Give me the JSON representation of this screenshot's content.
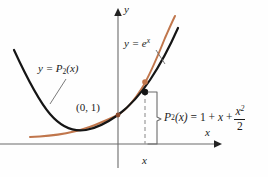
{
  "figure": {
    "kind": "math-graph",
    "background_color": "#fefefe",
    "axes": {
      "y_label": "y",
      "x_label": "x",
      "x_tick_label": "x",
      "axis_color": "#6b6b6b"
    },
    "curves": [
      {
        "name": "exponential",
        "label_text": "y = e",
        "label_exponent": "x",
        "color": "#c0764c"
      },
      {
        "name": "taylor-polynomial",
        "label_text": "y = P",
        "label_subscript": "2",
        "label_suffix": "(x)",
        "color": "#151515"
      }
    ],
    "annotations": {
      "tangent_point_label": "(0, 1)",
      "formula": {
        "lhs_base": "P",
        "lhs_subscript": "2",
        "lhs_arg": "(x)",
        "equals": "=",
        "term_one": "1",
        "plus_one": "+",
        "term_x": "x",
        "plus_two": "+",
        "frac_numerator_base": "x",
        "frac_numerator_exponent": "2",
        "frac_denominator": "2"
      }
    }
  }
}
